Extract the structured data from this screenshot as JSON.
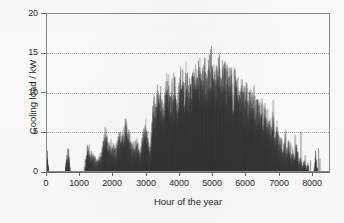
{
  "chart_data": {
    "type": "bar",
    "title": "",
    "subtitle": "",
    "xlabel": "Hour of the year",
    "ylabel": "Cooling load / kW",
    "xlim": [
      0,
      8760
    ],
    "ylim": [
      0,
      20
    ],
    "xticks": [
      0,
      1000,
      2000,
      3000,
      4000,
      5000,
      6000,
      7000,
      8000
    ],
    "xticklabels": [
      "0",
      "1000",
      "2000",
      "3000",
      "4000",
      "5000",
      "6000",
      "7000",
      "8000"
    ],
    "yticks": [
      0,
      5,
      10,
      15,
      20
    ],
    "yticklabels": [
      "0",
      "5",
      "10",
      "15",
      "20"
    ],
    "grid": "horizontal-dotted",
    "gridlines_y": [
      5,
      10,
      15
    ],
    "legend": null,
    "legend_position": "none",
    "series_name": "Cooling load",
    "bar_color": "#3a3a3a",
    "axis_color": "#6e6e6e",
    "grid_color": "#a9a9a9",
    "background_color": "#ffffff",
    "annotations": [],
    "max_value": 16.1,
    "min_value": 0,
    "nonzero_hours_approx": 2100,
    "x": [
      0,
      60,
      120,
      180,
      240,
      300,
      360,
      420,
      480,
      540,
      600,
      660,
      720,
      780,
      840,
      900,
      960,
      1020,
      1080,
      1140,
      1200,
      1260,
      1320,
      1380,
      1440,
      1500,
      1560,
      1620,
      1680,
      1740,
      1800,
      1860,
      1920,
      1980,
      2040,
      2100,
      2160,
      2220,
      2280,
      2340,
      2400,
      2460,
      2520,
      2580,
      2640,
      2700,
      2760,
      2820,
      2880,
      2940,
      3000,
      3060,
      3120,
      3180,
      3240,
      3300,
      3360,
      3420,
      3480,
      3540,
      3600,
      3660,
      3720,
      3780,
      3840,
      3900,
      3960,
      4020,
      4080,
      4140,
      4200,
      4260,
      4320,
      4380,
      4440,
      4500,
      4560,
      4620,
      4680,
      4740,
      4800,
      4860,
      4920,
      4980,
      5040,
      5100,
      5160,
      5220,
      5280,
      5340,
      5400,
      5460,
      5520,
      5580,
      5640,
      5700,
      5760,
      5820,
      5880,
      5940,
      6000,
      6060,
      6120,
      6180,
      6240,
      6300,
      6360,
      6420,
      6480,
      6540,
      6600,
      6660,
      6720,
      6780,
      6840,
      6900,
      6960,
      7020,
      7080,
      7140,
      7200,
      7260,
      7320,
      7380,
      7440,
      7500,
      7560,
      7620,
      7680,
      7740,
      7800,
      7860,
      7920,
      7980,
      8040,
      8100,
      8160,
      8220,
      8280,
      8340,
      8400,
      8460,
      8520,
      8580,
      8640,
      8700,
      8760
    ],
    "envelope": [
      2.6,
      0,
      0,
      0,
      0,
      0,
      0,
      0,
      0,
      0,
      2.8,
      2.9,
      0,
      0,
      0,
      0,
      0,
      0,
      0,
      0,
      2.0,
      3.2,
      3.6,
      2.4,
      3.0,
      2.2,
      1.4,
      2.6,
      3.1,
      5.4,
      6.0,
      5.0,
      3.8,
      4.4,
      4.0,
      3.2,
      4.2,
      5.1,
      6.2,
      5.0,
      6.6,
      7.3,
      5.9,
      4.8,
      4.1,
      3.6,
      5.2,
      4.6,
      3.0,
      4.4,
      6.4,
      7.8,
      5.6,
      4.2,
      6.0,
      10.6,
      9.1,
      11.0,
      12.4,
      10.2,
      9.6,
      11.4,
      13.1,
      12.0,
      10.8,
      12.6,
      13.8,
      11.2,
      12.2,
      14.0,
      13.2,
      12.8,
      14.6,
      13.4,
      12.1,
      13.9,
      14.8,
      13.0,
      14.2,
      15.0,
      13.6,
      14.4,
      15.6,
      14.0,
      15.2,
      16.1,
      14.6,
      15.4,
      14.2,
      15.8,
      14.9,
      13.8,
      15.1,
      14.4,
      13.2,
      14.8,
      12.9,
      13.6,
      12.2,
      13.0,
      11.8,
      12.6,
      11.0,
      12.0,
      10.4,
      11.6,
      10.0,
      11.2,
      9.4,
      10.6,
      9.0,
      10.2,
      8.4,
      9.6,
      7.8,
      8.2,
      6.0,
      9.8,
      5.4,
      6.8,
      4.2,
      5.6,
      3.4,
      4.8,
      2.8,
      5.0,
      2.2,
      3.6,
      1.8,
      4.4,
      1.4,
      2.6,
      1.0,
      2.0,
      0.6,
      1.4,
      0,
      0,
      0,
      3.0,
      0,
      0,
      0,
      0,
      0,
      0
    ]
  },
  "figure": {
    "caption": "",
    "source_note": ""
  }
}
